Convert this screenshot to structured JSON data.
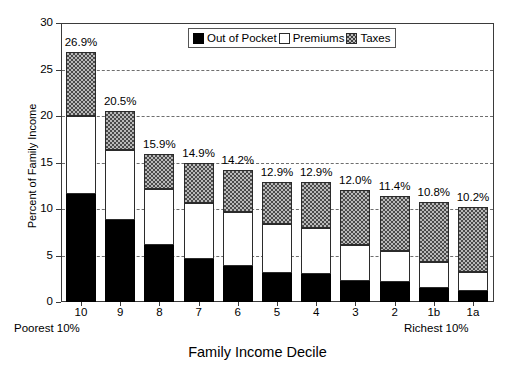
{
  "chart_data": {
    "type": "bar",
    "title": "",
    "xlabel": "Family Income Decile",
    "ylabel": "Percent of Family Income",
    "ylim": [
      0,
      30
    ],
    "ytick_values": [
      0,
      5,
      10,
      15,
      20,
      25,
      30
    ],
    "ytick_labels": [
      "0",
      "5",
      "10",
      "15",
      "20",
      "25",
      "30"
    ],
    "grid": true,
    "grid_axis": "y",
    "stacked": true,
    "legend_position": "top-center",
    "categories": [
      "10",
      "9",
      "8",
      "7",
      "6",
      "5",
      "4",
      "3",
      "2",
      "1b",
      "1a"
    ],
    "series": [
      {
        "name": "Out of Pocket",
        "fill": "solid-black",
        "color": "#000000",
        "values": [
          11.6,
          8.8,
          6.1,
          4.6,
          3.9,
          3.1,
          3.0,
          2.3,
          2.1,
          1.5,
          1.2
        ]
      },
      {
        "name": "Premiums",
        "fill": "white",
        "color": "#ffffff",
        "values": [
          8.4,
          7.5,
          6.0,
          6.0,
          5.8,
          5.3,
          5.0,
          3.8,
          3.4,
          2.8,
          2.0
        ]
      },
      {
        "name": "Taxes",
        "fill": "checkered-gray",
        "color": "#b9b9b9",
        "values": [
          6.9,
          4.2,
          3.8,
          4.3,
          4.5,
          4.5,
          4.9,
          5.9,
          5.9,
          6.5,
          7.0
        ]
      }
    ],
    "totals": [
      26.9,
      20.5,
      15.9,
      14.9,
      14.2,
      12.9,
      12.9,
      12.0,
      11.4,
      10.8,
      10.2
    ],
    "total_labels": [
      "26.9%",
      "20.5%",
      "15.9%",
      "14.9%",
      "14.2%",
      "12.9%",
      "12.9%",
      "12.0%",
      "11.4%",
      "10.8%",
      "10.2%"
    ],
    "annotations": [
      {
        "text": "Poorest 10%",
        "anchor": "left-axis-end"
      },
      {
        "text": "Richest 10%",
        "anchor": "right-axis-end"
      }
    ]
  },
  "legend": {
    "items": [
      {
        "label": "Out of Pocket",
        "swatch": "solid-black-swatch"
      },
      {
        "label": "Premiums",
        "swatch": "white-swatch"
      },
      {
        "label": "Taxes",
        "swatch": "checkered-gray-swatch"
      }
    ]
  }
}
